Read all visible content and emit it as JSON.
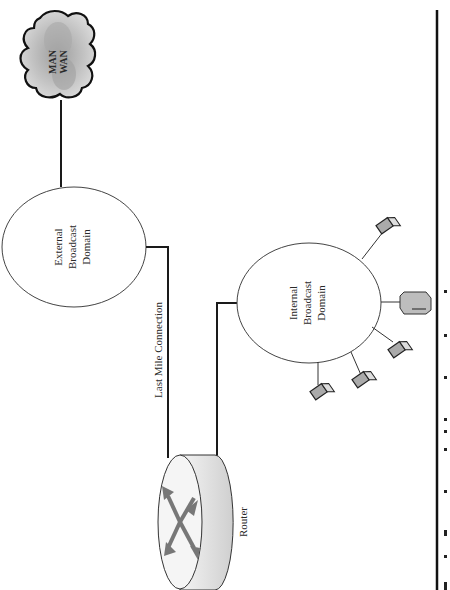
{
  "diagram": {
    "orientation": "rotated 90deg clockwise (text reads bottom-to-top)",
    "nodes": {
      "cloud": {
        "line1": "MAN",
        "line2": "WAN"
      },
      "external_domain": {
        "line1": "External",
        "line2": "Broadcast",
        "line3": "Domain"
      },
      "internal_domain": {
        "line1": "Internal",
        "line2": "Broadcast",
        "line3": "Domain"
      },
      "router": {
        "label": "Router"
      }
    },
    "edges": {
      "last_mile": {
        "label": "Last Mile Connection"
      }
    },
    "devices": [
      {
        "type": "laptop"
      },
      {
        "type": "laptop"
      },
      {
        "type": "laptop"
      },
      {
        "type": "server"
      },
      {
        "type": "laptop"
      }
    ],
    "colors": {
      "line": "#1a1a1a",
      "cloud_fill": "#bdbdbd",
      "cloud_outline": "#111111",
      "router_arrows": "#777777",
      "device_fill": "#a9a9a9"
    }
  }
}
